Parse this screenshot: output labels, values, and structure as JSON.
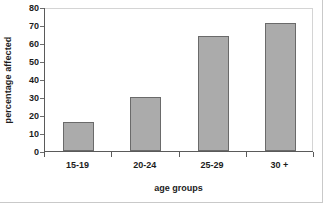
{
  "chart_data": {
    "type": "bar",
    "title": "",
    "xlabel": "age groups",
    "ylabel": "percentage affected",
    "categories": [
      "15-19",
      "20-24",
      "25-29",
      "30 +"
    ],
    "values": [
      16,
      30,
      64,
      71
    ],
    "ylim": [
      0,
      80
    ],
    "yticks": [
      0,
      10,
      20,
      30,
      40,
      50,
      60,
      70,
      80
    ],
    "ytick_labels": [
      "0",
      "10",
      "20",
      "30",
      "40",
      "50",
      "60",
      "70",
      "80"
    ],
    "grid": false,
    "legend": null,
    "series": [
      {
        "name": "percentage affected",
        "values": [
          16,
          30,
          64,
          71
        ]
      }
    ],
    "colors": {
      "bar_fill": "#ababab",
      "bar_border": "#6a6a6a",
      "axis": "#5a5a5a",
      "text": "#1c1c1c",
      "plot_background": "#ffffff",
      "frame_light": "#d4d4d4"
    }
  }
}
